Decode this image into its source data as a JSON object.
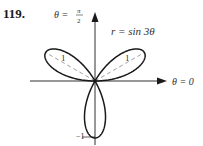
{
  "problem": {
    "number": "119."
  },
  "chart_data": {
    "type": "line",
    "subtype": "polar",
    "equation": "r = sin 3θ",
    "title": "",
    "axis_labels": {
      "polar_axis": "θ = 0",
      "vertical_axis_num": "π",
      "vertical_axis_prefix": "θ =",
      "vertical_axis_den": "2"
    },
    "petal_labels": [
      "1",
      "1"
    ],
    "bottom_label": "−1",
    "theta_range": [
      0,
      3.14159
    ],
    "r_max": 1,
    "petals": [
      {
        "center_angle_deg": 30,
        "length": 1
      },
      {
        "center_angle_deg": 150,
        "length": 1
      },
      {
        "center_angle_deg": 270,
        "length": 1
      }
    ],
    "dashed_axes_of_petals": [
      30,
      150
    ],
    "colors": {
      "curve": "#1a1a1a",
      "axes": "#1a1a1a",
      "dash": "#888888"
    }
  }
}
